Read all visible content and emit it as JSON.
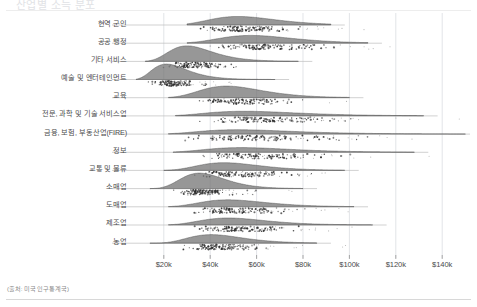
{
  "title": "산업별 소득 분포",
  "source_note": "(출처: 미국 인구통계국)",
  "axis": {
    "x_ticks": [
      {
        "label": "$20k",
        "value": 20000
      },
      {
        "label": "$40k",
        "value": 40000
      },
      {
        "label": "$60k",
        "value": 60000
      },
      {
        "label": "$80k",
        "value": 80000
      },
      {
        "label": "$100k",
        "value": 100000
      },
      {
        "label": "$120k",
        "value": 120000
      },
      {
        "label": "$140k",
        "value": 140000
      }
    ],
    "x_min": 5000,
    "x_max": 152000,
    "xlabel": "",
    "ylabel": ""
  },
  "chart_data": {
    "type": "area",
    "title": "산업별 소득 분포",
    "xlabel": "",
    "ylabel": "",
    "xlim": [
      5000,
      152000
    ],
    "grid": true,
    "legend": null,
    "categories": [
      "현역 군인",
      "공공 행정",
      "기타 서비스",
      "예술 및 엔터테인먼트",
      "교육",
      "전문, 과학 및 기술 서비스업",
      "금융, 보험, 부동산업(FIRE)",
      "정보",
      "교통 및 물류",
      "소매업",
      "도매업",
      "제조업",
      "농업"
    ],
    "series": [
      {
        "name": "현역 군인",
        "median": 56000,
        "spread": 18000,
        "peak_height": 0.55,
        "tail_right": 92000,
        "tail_left": 30000
      },
      {
        "name": "공공 행정",
        "median": 62000,
        "spread": 20000,
        "peak_height": 0.5,
        "tail_right": 108000,
        "tail_left": 30000
      },
      {
        "name": "기타 서비스",
        "median": 33000,
        "spread": 12000,
        "peak_height": 1.0,
        "tail_right": 78000,
        "tail_left": 12000
      },
      {
        "name": "예술 및 엔터테인먼트",
        "median": 24000,
        "spread": 10000,
        "peak_height": 1.0,
        "tail_right": 68000,
        "tail_left": 8000
      },
      {
        "name": "교육",
        "median": 51000,
        "spread": 17000,
        "peak_height": 0.75,
        "tail_right": 100000,
        "tail_left": 22000
      },
      {
        "name": "전문, 과학 및 기술 서비스업",
        "median": 62000,
        "spread": 26000,
        "peak_height": 0.3,
        "tail_right": 132000,
        "tail_left": 25000
      },
      {
        "name": "금융, 보험, 부동산업(FIRE)",
        "median": 60000,
        "spread": 27000,
        "peak_height": 0.28,
        "tail_right": 150000,
        "tail_left": 22000
      },
      {
        "name": "정보",
        "median": 60000,
        "spread": 24000,
        "peak_height": 0.3,
        "tail_right": 128000,
        "tail_left": 24000
      },
      {
        "name": "교통 및 물류",
        "median": 50000,
        "spread": 17000,
        "peak_height": 0.5,
        "tail_right": 98000,
        "tail_left": 20000
      },
      {
        "name": "소매업",
        "median": 38000,
        "spread": 12000,
        "peak_height": 1.0,
        "tail_right": 80000,
        "tail_left": 14000
      },
      {
        "name": "도매업",
        "median": 52000,
        "spread": 18000,
        "peak_height": 0.45,
        "tail_right": 102000,
        "tail_left": 22000
      },
      {
        "name": "제조업",
        "median": 52000,
        "spread": 18000,
        "peak_height": 0.45,
        "tail_right": 110000,
        "tail_left": 22000
      },
      {
        "name": "농업",
        "median": 44000,
        "spread": 15000,
        "peak_height": 0.55,
        "tail_right": 86000,
        "tail_left": 14000
      }
    ]
  },
  "colors": {
    "density_fill": "#6f6f6f",
    "point": "#2e2e2e",
    "gridline": "#d6d9de",
    "baseline": "#bdbdbd",
    "text": "#4b4b4b",
    "muted": "#8a8a8a"
  }
}
